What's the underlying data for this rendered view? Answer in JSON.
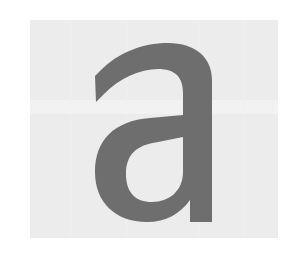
{
  "specimen": {
    "glyph_character": "a",
    "glyph_name": "latin-small-letter-a",
    "style_description": "double-storey grotesque sans-serif lowercase a",
    "glyph_color": "#6e6e6e",
    "panel_color": "#ececec",
    "panel_band_color": "#f2f2f2",
    "page_background_color": "#ffffff",
    "panel": {
      "left": 30,
      "top": 20,
      "width": 248,
      "height": 218
    },
    "glyph_bounds": {
      "left": 95,
      "top": 43,
      "right": 212,
      "bottom": 222,
      "width": 117,
      "height": 179
    }
  }
}
